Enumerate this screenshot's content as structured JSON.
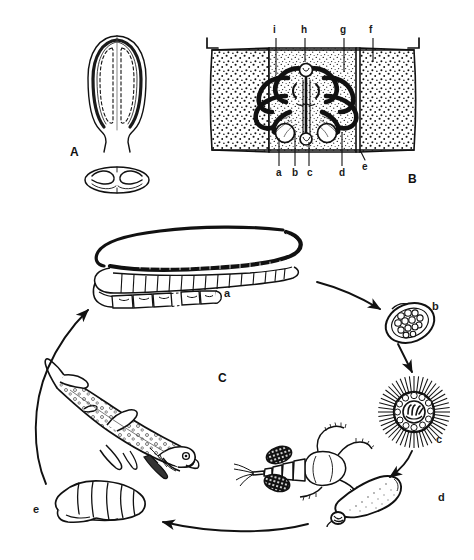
{
  "figure": {
    "background_color": "#ffffff",
    "ink_color": "#111111",
    "width": 474,
    "height": 560
  },
  "panels": [
    {
      "id": "A",
      "letter": "A",
      "letter_x": 70,
      "letter_y": 145,
      "caption": "scolex of adult tapeworm, lateral view above and apical view below",
      "parts": [
        {
          "name": "scolex-lateral",
          "description": "elongate spatulate scolex with two deep longitudinal bothria shown as dashed outlines"
        },
        {
          "name": "scolex-apical",
          "description": "apical view showing the paired slit-like bothria"
        }
      ]
    },
    {
      "id": "B",
      "letter": "B",
      "letter_x": 408,
      "letter_y": 180,
      "caption": "gravid proglottid showing internal reproductive anatomy, flanked by adjacent stippled segments",
      "leader_labels_top": [
        {
          "key": "i",
          "label": "i",
          "x": 275,
          "y": 30,
          "line_x": 276,
          "line_y1": 38,
          "line_y2": 75
        },
        {
          "key": "h",
          "label": "h",
          "x": 303,
          "y": 30,
          "line_x": 305,
          "line_y1": 38,
          "line_y2": 62
        },
        {
          "key": "g",
          "label": "g",
          "x": 342,
          "y": 30,
          "line_x": 344,
          "line_y1": 38,
          "line_y2": 72
        },
        {
          "key": "f",
          "label": "f",
          "x": 371,
          "y": 30,
          "line_x": 373,
          "line_y1": 38,
          "line_y2": 62
        }
      ],
      "leader_labels_bottom": [
        {
          "key": "a",
          "label": "a",
          "x": 277,
          "y": 170,
          "line_x": 279,
          "line_y1": 138,
          "line_y2": 166
        },
        {
          "key": "b",
          "label": "b",
          "x": 293,
          "y": 170,
          "line_x": 295,
          "line_y1": 130,
          "line_y2": 166
        },
        {
          "key": "c",
          "label": "c",
          "x": 308,
          "y": 170,
          "line_x": 309,
          "line_y1": 140,
          "line_y2": 166
        },
        {
          "key": "d",
          "label": "d",
          "x": 340,
          "y": 170,
          "line_x": 342,
          "line_y1": 132,
          "line_y2": 166
        },
        {
          "key": "e",
          "label": "e",
          "x": 363,
          "y": 165,
          "line_x": 365,
          "line_y1": 145,
          "line_y2": 160
        }
      ]
    },
    {
      "id": "C",
      "letter": "C",
      "letter_x": 218,
      "letter_y": 371,
      "caption": "life cycle of the broad fish tapeworm",
      "stages": [
        {
          "key": "a",
          "label": "a",
          "label_x": 224,
          "label_y": 288,
          "name": "adult-tapeworm",
          "description": "long segmented strobila of the adult worm in the definitive host intestine"
        },
        {
          "key": "b",
          "label": "b",
          "label_x": 432,
          "label_y": 301,
          "name": "egg",
          "description": "operculate egg containing cleaving embryonic cells"
        },
        {
          "key": "c",
          "label": "c",
          "label_x": 436,
          "label_y": 434,
          "name": "coracidium",
          "description": "free-swimming ciliated coracidium with hexacanth oncosphere"
        },
        {
          "key": "d",
          "label": "d",
          "label_x": 438,
          "label_y": 492,
          "name": "procercoid",
          "description": "procercoid larva with cercomer, developing in a copepod"
        },
        {
          "key": "e",
          "label": "e",
          "label_x": 33,
          "label_y": 504,
          "name": "plerocercoid",
          "description": "plerocercoid (sparganum) larva from fish musculature"
        }
      ],
      "hosts": [
        {
          "name": "copepod",
          "description": "adult cyclopoid copepod with paired egg sacs, first intermediate host"
        },
        {
          "name": "fish",
          "description": "freshwater fish, second intermediate host"
        }
      ],
      "arrows": [
        {
          "name": "arrow-adult-to-egg",
          "from": "a",
          "to": "b"
        },
        {
          "name": "arrow-egg-to-coracidium",
          "from": "b",
          "to": "c"
        },
        {
          "name": "arrow-coracidium-to-procercoid",
          "from": "c",
          "to": "d"
        },
        {
          "name": "arrow-procercoid-to-plerocercoid",
          "from": "d",
          "to": "e"
        },
        {
          "name": "arrow-plerocercoid-to-adult",
          "from": "e",
          "to": "a"
        }
      ]
    }
  ]
}
